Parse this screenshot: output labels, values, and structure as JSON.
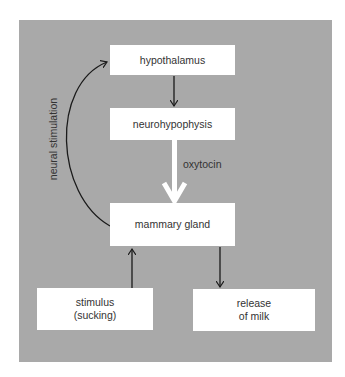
{
  "diagram": {
    "nodes": {
      "hypothalamus": "hypothalamus",
      "neurohypophysis": "neurohypophysis",
      "mammary_gland": "mammary gland",
      "stimulus": "stimulus\n(sucking)",
      "release": "release\nof milk"
    },
    "edge_labels": {
      "oxytocin": "oxytocin",
      "neural_stimulation": "neural stimulation"
    },
    "colors": {
      "background": "#a9a9a9",
      "box": "#ffffff",
      "arrow": "#1a1a1a",
      "hormone_arrow": "#ffffff"
    }
  }
}
